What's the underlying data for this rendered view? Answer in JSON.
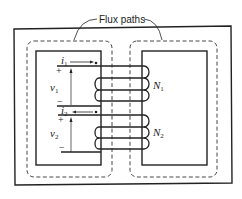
{
  "diagram": {
    "type": "transformer-core-cross-section",
    "colors": {
      "stroke": "#222222",
      "background": "#ffffff"
    },
    "annotation": {
      "label": "Flux paths"
    },
    "primary": {
      "current_label": "i",
      "current_sub": "1",
      "voltage_label": "v",
      "voltage_sub": "1",
      "plus": "+",
      "minus": "−",
      "turns_label": "N",
      "turns_sub": "1"
    },
    "secondary": {
      "current_label": "i",
      "current_sub": "2",
      "voltage_label": "v",
      "voltage_sub": "2",
      "plus": "+",
      "minus": "−",
      "turns_label": "N",
      "turns_sub": "2"
    }
  }
}
